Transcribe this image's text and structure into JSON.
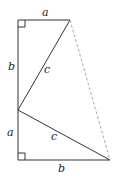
{
  "diagram": {
    "points": {
      "top_left": [
        18,
        20
      ],
      "top_right": [
        70,
        20
      ],
      "mid_left": [
        18,
        110
      ],
      "bottom_left": [
        18,
        160
      ],
      "bottom_right": [
        110,
        160
      ]
    },
    "labels": {
      "top_a": "a",
      "left_b": "b",
      "upper_c": "c",
      "left_a": "a",
      "lower_c": "c",
      "bottom_b": "b"
    },
    "colors": {
      "line": "#333333",
      "dashed": "#aaaaaa"
    }
  }
}
